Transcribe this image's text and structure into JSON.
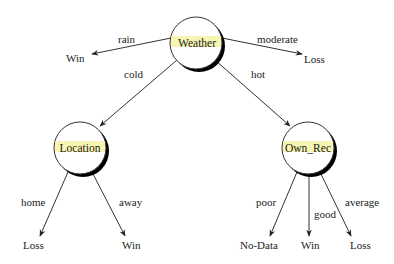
{
  "colors": {
    "background": "#ffffff",
    "line": "#333333",
    "node_fill": "#ffffff",
    "node_shadow": "#000000",
    "highlight": "#f6f3a0",
    "text": "#222222"
  },
  "tree": {
    "root": {
      "label": "Weather",
      "branches": [
        {
          "edge": "rain",
          "leaf": "Win"
        },
        {
          "edge": "moderate",
          "leaf": "Loss"
        },
        {
          "edge": "cold",
          "child": "Location"
        },
        {
          "edge": "hot",
          "child": "Own_Rec"
        }
      ]
    },
    "location": {
      "label": "Location",
      "branches": [
        {
          "edge": "home",
          "leaf": "Loss"
        },
        {
          "edge": "away",
          "leaf": "Win"
        }
      ]
    },
    "own_rec": {
      "label": "Own_Rec",
      "branches": [
        {
          "edge": "poor",
          "leaf": "No-Data"
        },
        {
          "edge": "good",
          "leaf": "Win"
        },
        {
          "edge": "average",
          "leaf": "Loss"
        }
      ]
    }
  }
}
